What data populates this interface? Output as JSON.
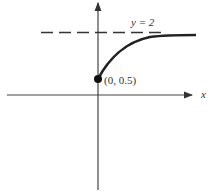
{
  "diagram": {
    "type": "function-graph",
    "axes": {
      "x_label": "x",
      "y_label": ""
    },
    "asymptote": {
      "label": "y = 2",
      "value": 2,
      "style": "dashed"
    },
    "point": {
      "label": "(0, 0.5)",
      "x": 0,
      "y": 0.5,
      "filled": true
    },
    "curve": {
      "description": "increasing concave-down curve starting at (0, 0.5) approaching y = 2"
    }
  },
  "colors": {
    "stroke": "#333333",
    "background": "#ffffff"
  }
}
